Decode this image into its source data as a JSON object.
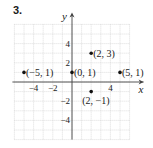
{
  "problem_number": "3.",
  "chart_data": {
    "type": "scatter",
    "title": "",
    "xlabel": "x",
    "ylabel": "y",
    "xlim": [
      -6,
      6
    ],
    "ylim": [
      -6,
      6
    ],
    "grid": true,
    "x_ticks": [
      -4,
      -2,
      4
    ],
    "y_ticks": [
      4,
      2,
      -2,
      -4
    ],
    "points": [
      {
        "x": -5,
        "y": 1,
        "label": "(−5, 1)"
      },
      {
        "x": 0,
        "y": 1,
        "label": "(0, 1)"
      },
      {
        "x": 2,
        "y": 3,
        "label": "(2, 3)"
      },
      {
        "x": 5,
        "y": 1,
        "label": "(5, 1)"
      },
      {
        "x": 2,
        "y": -1,
        "label": "(2, −1)"
      }
    ],
    "colors": {
      "grid": "#c8c8c8",
      "axis": "#444444",
      "point": "#111111"
    }
  }
}
